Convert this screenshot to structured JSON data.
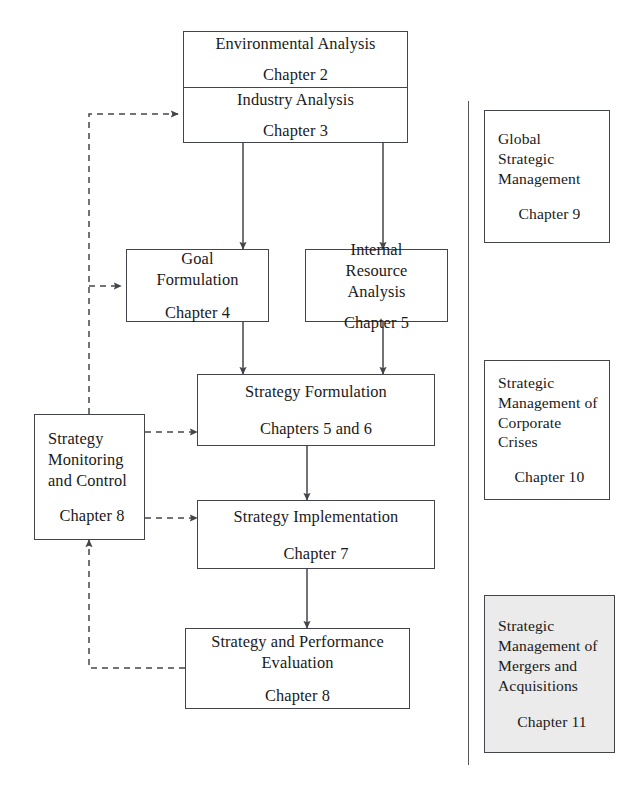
{
  "diagram": {
    "line_color": "#44454a",
    "shade_color": "#ebebeb",
    "text_color": "#1a1a1a"
  },
  "main_flow": {
    "environmental_analysis": {
      "title": "Environmental Analysis",
      "chapter": "Chapter 2"
    },
    "industry_analysis": {
      "title": "Industry Analysis",
      "chapter": "Chapter 3"
    },
    "goal_formulation": {
      "title": "Goal Formulation",
      "chapter": "Chapter 4"
    },
    "internal_resource_analysis": {
      "title": "Internal Resource Analysis",
      "chapter": "Chapter 5"
    },
    "strategy_formulation": {
      "title": "Strategy Formulation",
      "chapter": "Chapters 5 and 6"
    },
    "strategy_monitoring": {
      "title": "Strategy Monitoring and Control",
      "chapter": "Chapter 8"
    },
    "strategy_implementation": {
      "title": "Strategy Implementation",
      "chapter": "Chapter 7"
    },
    "strategy_evaluation": {
      "title": "Strategy and Performance Evaluation",
      "chapter": "Chapter 8"
    }
  },
  "side_panel": {
    "global_strategic_management": {
      "title": "Global Strategic Management",
      "chapter": "Chapter 9"
    },
    "corporate_crises": {
      "title": "Strategic Management of Corporate Crises",
      "chapter": "Chapter 10"
    },
    "mergers_acquisitions": {
      "title": "Strategic Management of Mergers and Acquisitions",
      "chapter": "Chapter 11"
    }
  },
  "connectors": {
    "solid_label": "process flow",
    "dashed_label": "feedback loop"
  }
}
